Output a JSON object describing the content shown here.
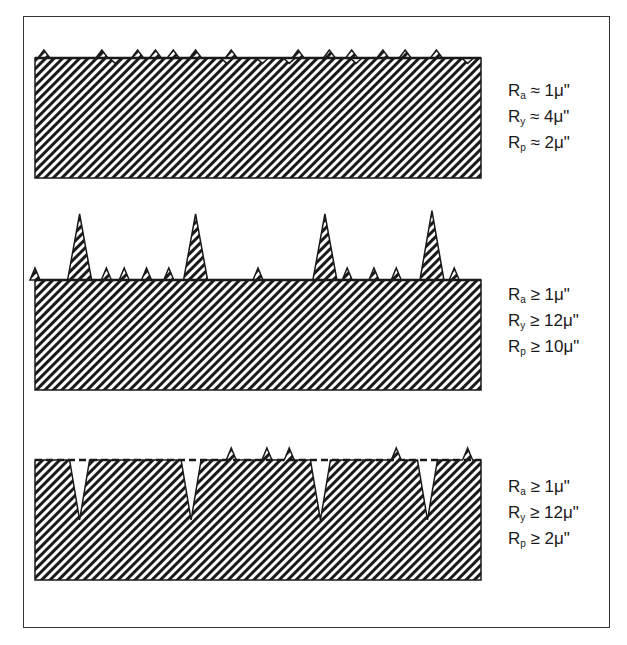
{
  "figure": {
    "panels": [
      {
        "id": "uniform",
        "profile": "small uniform peaks and valleys",
        "mean_line": "solid",
        "peaks_x": [
          0.02,
          0.15,
          0.23,
          0.27,
          0.31,
          0.36,
          0.44,
          0.59,
          0.66,
          0.71,
          0.78,
          0.83,
          0.9
        ],
        "peak_heights": [
          0.5,
          0.5,
          0.5,
          0.5,
          0.5,
          0.5,
          0.5,
          0.5,
          0.5,
          0.5,
          0.5,
          0.5,
          0.5
        ],
        "valleys_x": [
          0.18,
          0.43,
          0.51,
          0.57,
          0.72,
          0.97
        ],
        "valley_depths": [
          0.45,
          0.45,
          0.45,
          0.45,
          0.45,
          0.45
        ],
        "labels": [
          {
            "sym": "R",
            "sub": "a",
            "rel": "≈",
            "val": "1μ\""
          },
          {
            "sym": "R",
            "sub": "y",
            "rel": "≈",
            "val": "4μ\""
          },
          {
            "sym": "R",
            "sub": "p",
            "rel": "≈",
            "val": "2μ\""
          }
        ]
      },
      {
        "id": "peaks",
        "profile": "tall isolated peaks",
        "mean_line": "solid",
        "peaks_x": [
          0.1,
          0.36,
          0.65,
          0.89
        ],
        "peak_heights": [
          1.0,
          1.0,
          1.0,
          1.05
        ],
        "small_peaks_x": [
          0.0,
          0.16,
          0.2,
          0.25,
          0.3,
          0.5,
          0.7,
          0.76,
          0.81,
          0.94
        ],
        "labels": [
          {
            "sym": "R",
            "sub": "a",
            "rel": "≥",
            "val": "1μ\""
          },
          {
            "sym": "R",
            "sub": "y",
            "rel": "≥",
            "val": "12μ\""
          },
          {
            "sym": "R",
            "sub": "p",
            "rel": "≥",
            "val": "10μ\""
          }
        ]
      },
      {
        "id": "valleys",
        "profile": "deep isolated valleys",
        "mean_line": "dashed",
        "valleys_x": [
          0.1,
          0.35,
          0.64,
          0.88
        ],
        "valley_depths": [
          1.0,
          1.0,
          1.0,
          1.0
        ],
        "small_peaks_x": [
          0.44,
          0.52,
          0.57,
          0.81,
          0.97
        ],
        "labels": [
          {
            "sym": "R",
            "sub": "a",
            "rel": "≥",
            "val": "1μ\""
          },
          {
            "sym": "R",
            "sub": "y",
            "rel": "≥",
            "val": "12μ\""
          },
          {
            "sym": "R",
            "sub": "p",
            "rel": "≥",
            "val": "2μ\""
          }
        ]
      }
    ],
    "colors": {
      "ink": "#1a1a1a",
      "paper": "#ffffff",
      "frame": "#333333"
    }
  }
}
